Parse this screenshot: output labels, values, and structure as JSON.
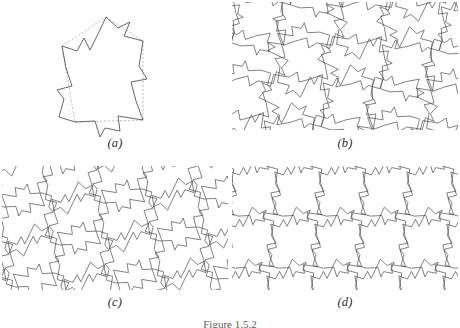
{
  "figure": {
    "caption": "Figure 1.5.2",
    "background_color": "#ffffff",
    "stroke_color": "#4a4a52",
    "dashed_color": "#9a9aa2",
    "label_color": "#2a2a2a"
  },
  "panels": [
    {
      "id": "a",
      "label": "(a)",
      "description": "single Escher-style tile outlined in solid line over its dashed base polygon",
      "kind": "single-tile"
    },
    {
      "id": "b",
      "label": "(b)",
      "description": "tessellation of the tile by 4-fold rotation about shared corners",
      "kind": "tessellation"
    },
    {
      "id": "c",
      "label": "(c)",
      "description": "tessellation of the tile in a second rotational arrangement",
      "kind": "tessellation"
    },
    {
      "id": "d",
      "label": "(d)",
      "description": "tessellation of the tile by pure translation in rows",
      "kind": "tessellation"
    }
  ],
  "chart_data": {
    "type": "line",
    "title": "Figure 1.5.2",
    "xlabel": "",
    "ylabel": "",
    "subplots": [
      {
        "panel": "a",
        "label": "(a)",
        "base_polygon_dashed": [
          [
            106,
            17
          ],
          [
            143,
            41
          ],
          [
            143,
            120
          ],
          [
            75,
            122
          ],
          [
            62,
            46
          ]
        ],
        "tile_outline_solid": [
          [
            106,
            17
          ],
          [
            118,
            28
          ],
          [
            130,
            22
          ],
          [
            124,
            36
          ],
          [
            143,
            41
          ],
          [
            139,
            66
          ],
          [
            147,
            79
          ],
          [
            131,
            82
          ],
          [
            136,
            101
          ],
          [
            143,
            120
          ],
          [
            118,
            116
          ],
          [
            120,
            131
          ],
          [
            105,
            128
          ],
          [
            100,
            137
          ],
          [
            95,
            121
          ],
          [
            75,
            122
          ],
          [
            59,
            117
          ],
          [
            64,
            99
          ],
          [
            57,
            90
          ],
          [
            72,
            86
          ],
          [
            66,
            68
          ],
          [
            62,
            46
          ],
          [
            77,
            51
          ],
          [
            84,
            38
          ],
          [
            90,
            50
          ],
          [
            97,
            36
          ],
          [
            106,
            17
          ]
        ]
      },
      {
        "panel": "b",
        "label": "(b)",
        "lattice": {
          "cols": 5,
          "rows": 4,
          "dx": 52,
          "dy": 40,
          "shear": -7,
          "rotation_set": [
            0,
            90,
            180,
            270
          ]
        }
      },
      {
        "panel": "c",
        "label": "(c)",
        "lattice": {
          "cols": 5,
          "rows": 4,
          "dx": 50,
          "dy": 40,
          "shear": 6,
          "rotation_set": [
            0,
            180
          ]
        }
      },
      {
        "panel": "d",
        "label": "(d)",
        "lattice": {
          "cols": 6,
          "rows": 3,
          "dx": 44,
          "dy": 52,
          "shear": -4,
          "rotation_set": [
            0
          ]
        }
      }
    ]
  }
}
